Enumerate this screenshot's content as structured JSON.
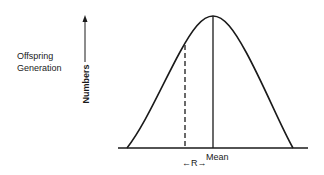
{
  "diagram": {
    "title_line1": "Offspring",
    "title_line2": "Generation",
    "y_axis_label": "Numbers",
    "mean_label": "Mean",
    "r_label": "R",
    "r_arrow_left": "←",
    "r_arrow_right": "→",
    "elements": [
      "normal-distribution-curve",
      "mean-line",
      "selection-threshold-dashed-line",
      "baseline",
      "y-axis-arrow"
    ],
    "colors": {
      "ink": "#1a1a1a",
      "background": "#ffffff"
    }
  }
}
